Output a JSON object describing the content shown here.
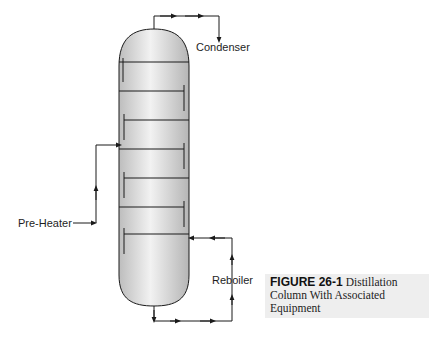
{
  "labels": {
    "condenser": "Condenser",
    "pre_heater": "Pre-Heater",
    "reboiler": "Reboiler"
  },
  "caption": {
    "figure_number": "FIGURE 26-1",
    "text": "Distillation Column With Associated Equipment"
  },
  "colors": {
    "line": "#1a1a1a",
    "column_fill_light": "#f4f4f4",
    "column_fill_dark": "#b8b8b8",
    "caption_bg": "#eeeeee"
  }
}
